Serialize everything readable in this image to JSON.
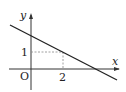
{
  "diagram": {
    "type": "coordinate-graph",
    "axes": {
      "x_label": "x",
      "y_label": "y",
      "origin_label": "O"
    },
    "ticks": {
      "x_tick_label": "2",
      "y_tick_label": "1"
    },
    "line": {
      "description": "decreasing straight line passing through (2, 1)",
      "marked_point": [
        2,
        1
      ]
    },
    "colors": {
      "axis": "#333333",
      "line": "#222222",
      "dashed_guide": "#888888"
    }
  }
}
